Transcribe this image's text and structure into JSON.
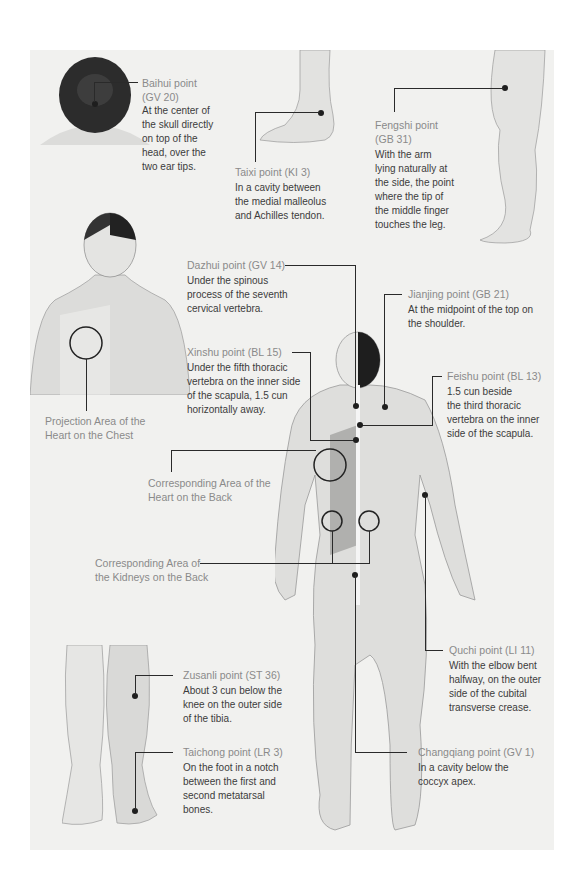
{
  "colors": {
    "background": "#f1f1ef",
    "page": "#ffffff",
    "label": "#8a8a8a",
    "text": "#3c3c3c",
    "leader": "#2a2a2a",
    "skin": "#e4e4e2"
  },
  "points": {
    "baihui": {
      "name": "Baihui point",
      "code": "(GV 20)",
      "desc": [
        "At the center of",
        "the skull directly",
        "on top of the",
        "head, over the",
        "two ear tips."
      ]
    },
    "taixi": {
      "name": "Taixi point (KI 3)",
      "desc": [
        "In a cavity between",
        "the medial malleolus",
        "and Achilles tendon."
      ]
    },
    "fengshi": {
      "name": "Fengshi point",
      "code": "(GB 31)",
      "desc": [
        "With the arm",
        "lying naturally at",
        "the side, the point",
        "where the tip of",
        "the middle finger",
        "touches the leg."
      ]
    },
    "dazhui": {
      "name": "Dazhui point (GV 14)",
      "desc": [
        "Under the spinous",
        "process of the seventh",
        "cervical vertebra."
      ]
    },
    "jianjing": {
      "name": "Jianjing point (GB 21)",
      "desc": [
        "At the midpoint of the top on",
        "the shoulder."
      ]
    },
    "xinshu": {
      "name": "Xinshu point (BL 15)",
      "desc": [
        "Under the fifth thoracic",
        "vertebra on the inner side",
        "of the scapula, 1.5 cun",
        "horizontally away."
      ]
    },
    "feishu": {
      "name": "Feishu point (BL 13)",
      "desc": [
        "1.5 cun beside",
        "the third thoracic",
        "vertebra on the inner",
        "side of the scapula."
      ]
    },
    "quchi": {
      "name": "Quchi point (LI 11)",
      "desc": [
        "With the elbow bent",
        "halfway, on the outer",
        "side of the cubital",
        "transverse crease."
      ]
    },
    "changqiang": {
      "name": "Changqiang point (GV 1)",
      "desc": [
        "In a cavity below the",
        "coccyx apex."
      ]
    },
    "zusanli": {
      "name": "Zusanli point (ST 36)",
      "desc": [
        "About 3 cun below the",
        "knee on the outer side",
        "of the tibia."
      ]
    },
    "taichong": {
      "name": "Taichong point (LR 3)",
      "desc": [
        "On the foot in a notch",
        "between the first and",
        "second metatarsal",
        "bones."
      ]
    }
  },
  "areas": {
    "heart_chest": [
      "Projection Area of the",
      "Heart on the Chest"
    ],
    "heart_back": [
      "Corresponding Area of the",
      "Heart on the Back"
    ],
    "kidneys_back": [
      "Corresponding Area of",
      "the Kidneys on the Back"
    ]
  }
}
